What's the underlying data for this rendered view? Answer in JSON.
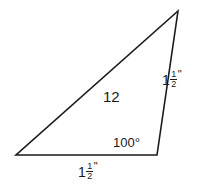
{
  "figure": {
    "type": "triangle-diagram",
    "background_color": "#ffffff",
    "stroke_color": "#1a1a1a",
    "text_color": "#1a1a1a",
    "stroke_width": 1.6,
    "vertices": {
      "apex": {
        "x": 178,
        "y": 11
      },
      "bottom_left": {
        "x": 16,
        "y": 155
      },
      "bottom_right": {
        "x": 157,
        "y": 155
      }
    }
  },
  "labels": {
    "interior": "12",
    "angle": "100°",
    "bottom_side": {
      "whole": "1",
      "numerator": "1",
      "denominator": "2",
      "unit": "\"",
      "plain": "1 1/2\""
    },
    "right_side": {
      "whole": "1",
      "numerator": "1",
      "denominator": "2",
      "unit": "\"",
      "plain": "1 1/2\""
    }
  }
}
